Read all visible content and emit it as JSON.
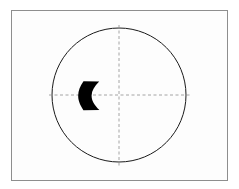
{
  "canvas": {
    "width": 239,
    "height": 189,
    "background_color": "#ffffff",
    "description": "Technical line drawing of a circle with dashed crosshair axes and a solid black crescent-shaped region"
  },
  "frame": {
    "name": "drawing-border",
    "x": 11,
    "y": 10,
    "width": 217,
    "height": 171,
    "stroke_color": "#8e8e8e",
    "stroke_width": 1,
    "fill_color": "#fdfdfd"
  },
  "circle": {
    "name": "main-circle",
    "center_x": 119,
    "center_y": 95,
    "radius": 67,
    "stroke_color": "#1a1a1a",
    "stroke_width": 1,
    "fill_color": "none"
  },
  "axes": {
    "stroke_color": "#9a9a9a",
    "stroke_width": 0.9,
    "dash_pattern": "3,2.5",
    "vertical": {
      "name": "vertical-center-axis",
      "x": 119,
      "y_start": 25,
      "y_end": 166
    },
    "horizontal": {
      "name": "horizontal-center-axis",
      "y": 95,
      "x_start": 49,
      "x_end": 190
    }
  },
  "crescent": {
    "name": "black-crescent-region",
    "fill_color": "#000000",
    "bounds": {
      "x": 78,
      "y": 81,
      "width": 23,
      "height": 30
    },
    "path": "M 83.5 81.2 L 99.2 81.6 C 94.4 86.5 91.8 90.6 91.6 95.4 C 91.5 100.4 94.2 104.9 99.4 110.0 L 83.4 110.2 C 79.6 104.4 78.1 100.0 78.2 95.5 C 78.3 90.9 79.9 86.4 83.5 81.2 Z",
    "description": "Solid black lune: straight-ish outer left arc with concave right boundary, centered on the horizontal axis, left of the vertical axis"
  },
  "labels": {
    "title": "",
    "annotations": []
  }
}
